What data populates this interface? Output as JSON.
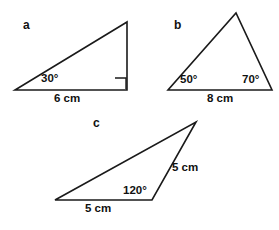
{
  "figure": {
    "background_color": "#ffffff",
    "stroke_color": "#1a1a1a",
    "text_color": "#111111",
    "width": 279,
    "height": 230
  },
  "triangles": [
    {
      "letter": "a",
      "letter_pos": {
        "x": 23,
        "y": 19
      },
      "type": "right-angled triangle",
      "vertices": {
        "left": {
          "x": 15,
          "y": 90
        },
        "right": {
          "x": 127,
          "y": 90
        },
        "apex": {
          "x": 127,
          "y": 22
        }
      },
      "right_angle": {
        "x": 115,
        "y": 78,
        "size": 11
      },
      "angle_label": {
        "text": "30°",
        "x": 41,
        "y": 73
      },
      "side_label": {
        "text": "6 cm",
        "x": 54,
        "y": 93
      }
    },
    {
      "letter": "b",
      "letter_pos": {
        "x": 174,
        "y": 19
      },
      "type": "scalene triangle",
      "vertices": {
        "left": {
          "x": 168,
          "y": 90
        },
        "right": {
          "x": 272,
          "y": 90
        },
        "apex": {
          "x": 236,
          "y": 13
        }
      },
      "angle_label_left": {
        "text": "50°",
        "x": 180,
        "y": 74
      },
      "angle_label_right": {
        "text": "70°",
        "x": 242,
        "y": 74
      },
      "side_label": {
        "text": "8 cm",
        "x": 207,
        "y": 93
      }
    },
    {
      "letter": "c",
      "letter_pos": {
        "x": 93,
        "y": 117
      },
      "type": "obtuse triangle",
      "vertices": {
        "left": {
          "x": 55,
          "y": 200
        },
        "right": {
          "x": 152,
          "y": 200
        },
        "apex": {
          "x": 196,
          "y": 122
        }
      },
      "angle_label": {
        "text": "120°",
        "x": 123,
        "y": 185
      },
      "side_label_bottom": {
        "text": "5 cm",
        "x": 85,
        "y": 203
      },
      "side_label_right": {
        "text": "5 cm",
        "x": 172,
        "y": 162
      }
    }
  ]
}
